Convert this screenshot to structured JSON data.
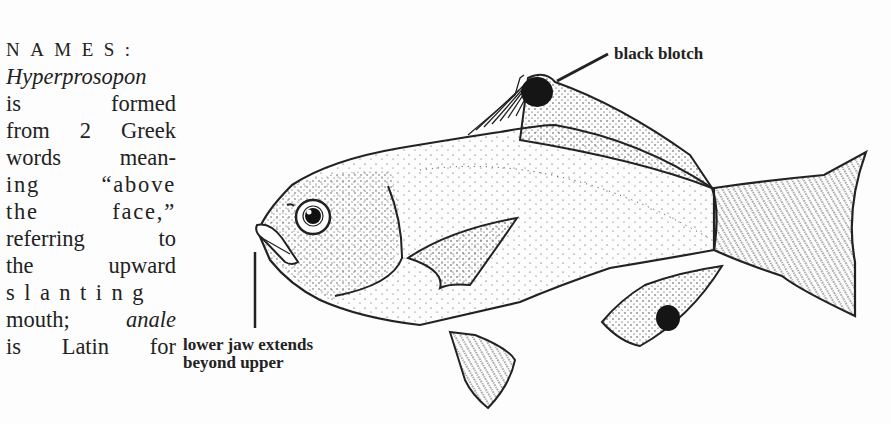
{
  "text_column": {
    "heading": "NAMES:",
    "lines": [
      {
        "text": "Hyperprosopon",
        "italic": true
      },
      {
        "text": "is formed"
      },
      {
        "text": "from 2 Greek"
      },
      {
        "text": "words mean-"
      },
      {
        "text": "ing “above"
      },
      {
        "text": "the face,”"
      },
      {
        "text": "referring to"
      },
      {
        "text": "the upward"
      },
      {
        "text": "slanting"
      }
    ],
    "line_mouth": {
      "pre": "mouth; ",
      "italic": "anale"
    },
    "line_last": "is Latin for"
  },
  "figure": {
    "labels": {
      "blotch": "black blotch",
      "jaw_line1": "lower jaw extends",
      "jaw_line2": "beyond upper"
    },
    "colors": {
      "ink": "#222222",
      "paper": "#fdfdfd"
    }
  }
}
